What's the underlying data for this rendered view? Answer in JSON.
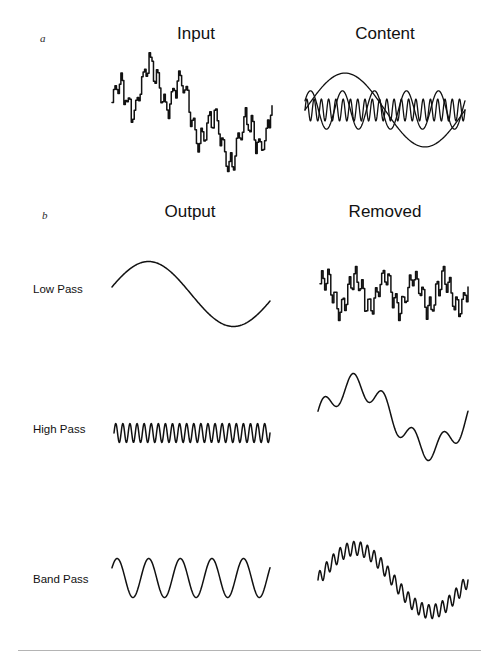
{
  "figure": {
    "panels": [
      {
        "letter": "a",
        "letter_x": 40,
        "letter_y": 32,
        "columns": [
          {
            "label": "Input",
            "cx": 196,
            "y": 24
          },
          {
            "label": "Content",
            "cx": 385,
            "y": 24
          }
        ]
      },
      {
        "letter": "b",
        "letter_x": 42,
        "letter_y": 209,
        "columns": [
          {
            "label": "Output",
            "cx": 190,
            "y": 202
          },
          {
            "label": "Removed",
            "cx": 385,
            "y": 202
          }
        ]
      }
    ],
    "row_labels": [
      {
        "text": "Low Pass",
        "x": 33,
        "y": 283
      },
      {
        "text": "High Pass",
        "x": 33,
        "y": 423
      },
      {
        "text": "Band Pass",
        "x": 33,
        "y": 573
      }
    ],
    "colors": {
      "ink": "#111111",
      "background": "#ffffff",
      "rule": "#b4b4b4"
    }
  },
  "chart_data": {
    "type": "line",
    "title": "",
    "xlabel": "",
    "ylabel": "",
    "grid": false,
    "legend_position": "none",
    "components": [
      {
        "name": "slow",
        "cycles": 1,
        "amplitude": 1.0,
        "role": "low-frequency content"
      },
      {
        "name": "medium",
        "cycles": 5,
        "amplitude": 0.52,
        "role": "mid-band content"
      },
      {
        "name": "fast",
        "cycles": 22,
        "amplitude": 0.22,
        "role": "high-frequency content"
      }
    ],
    "plots": [
      {
        "id": "input",
        "panel": "a",
        "column": "Input",
        "caption": "Input",
        "contains": [
          "slow",
          "medium",
          "fast"
        ],
        "style": "stepped-noisy",
        "box": {
          "x": 112,
          "y": 58,
          "w": 160,
          "h": 110
        },
        "xlim": [
          0,
          1
        ],
        "ylim": [
          -1.8,
          1.8
        ]
      },
      {
        "id": "content",
        "panel": "a",
        "column": "Content",
        "caption": "Content",
        "contains": [
          "slow",
          "medium",
          "fast"
        ],
        "style": "overlaid-components",
        "overlaid_traces": [
          "slow",
          "medium",
          "fast"
        ],
        "box": {
          "x": 305,
          "y": 62,
          "w": 160,
          "h": 96
        },
        "xlim": [
          0,
          1
        ],
        "ylim": [
          -1.3,
          1.3
        ]
      },
      {
        "id": "lowpass-output",
        "panel": "b",
        "row": "Low Pass",
        "column": "Output",
        "contains": [
          "slow"
        ],
        "style": "smooth",
        "box": {
          "x": 112,
          "y": 255,
          "w": 158,
          "h": 78
        },
        "xlim": [
          0,
          1
        ],
        "ylim": [
          -1.2,
          1.2
        ]
      },
      {
        "id": "lowpass-removed",
        "panel": "b",
        "row": "Low Pass",
        "column": "Removed",
        "contains": [
          "medium",
          "fast"
        ],
        "style": "stepped-noisy",
        "box": {
          "x": 320,
          "y": 265,
          "w": 148,
          "h": 56
        },
        "xlim": [
          0,
          1
        ],
        "ylim": [
          -0.9,
          0.9
        ]
      },
      {
        "id": "highpass-output",
        "panel": "b",
        "row": "High Pass",
        "column": "Output",
        "contains": [
          "fast"
        ],
        "style": "smooth",
        "box": {
          "x": 114,
          "y": 418,
          "w": 156,
          "h": 30
        },
        "xlim": [
          0,
          1
        ],
        "ylim": [
          -0.35,
          0.35
        ]
      },
      {
        "id": "highpass-removed",
        "panel": "b",
        "row": "High Pass",
        "column": "Removed",
        "contains": [
          "slow",
          "medium"
        ],
        "style": "smooth",
        "box": {
          "x": 318,
          "y": 372,
          "w": 150,
          "h": 90
        },
        "xlim": [
          0,
          1
        ],
        "ylim": [
          -1.5,
          1.5
        ]
      },
      {
        "id": "bandpass-output",
        "panel": "b",
        "row": "Band Pass",
        "column": "Output",
        "contains": [
          "medium"
        ],
        "style": "smooth",
        "box": {
          "x": 112,
          "y": 548,
          "w": 158,
          "h": 60
        },
        "xlim": [
          0,
          1
        ],
        "ylim": [
          -0.8,
          0.8
        ]
      },
      {
        "id": "bandpass-removed",
        "panel": "b",
        "row": "Band Pass",
        "column": "Removed",
        "contains": [
          "slow",
          "fast"
        ],
        "style": "smooth",
        "box": {
          "x": 318,
          "y": 540,
          "w": 150,
          "h": 80
        },
        "xlim": [
          0,
          1
        ],
        "ylim": [
          -1.2,
          1.2
        ]
      }
    ]
  }
}
